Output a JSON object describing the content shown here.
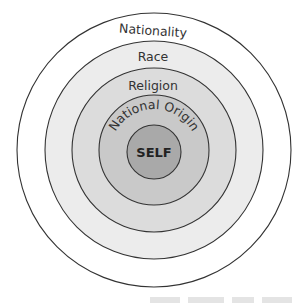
{
  "diagram": {
    "type": "concentric-circles",
    "center": {
      "x": 154,
      "y": 150
    },
    "rings": [
      {
        "label": "Nationality",
        "radius": 137,
        "fill": "#ffffff"
      },
      {
        "label": "Race",
        "radius": 109,
        "fill": "#ececec"
      },
      {
        "label": "Religion",
        "radius": 82,
        "fill": "#dcdcdc"
      },
      {
        "label": "National Origin",
        "radius": 55,
        "fill": "#c9c9c9"
      },
      {
        "label": "SELF",
        "radius": 27,
        "fill": "#a9a9a9"
      }
    ],
    "stroke_color": "#333333"
  }
}
